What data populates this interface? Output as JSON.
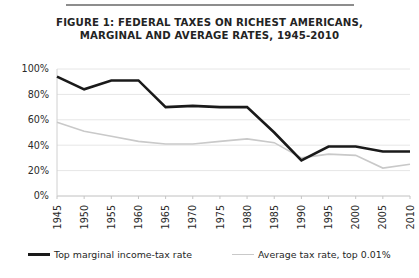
{
  "figure": {
    "rule_color": "#8d8d8d",
    "title_line1": "FIGURE 1: FEDERAL TAXES ON RICHEST AMERICANS,",
    "title_line2": "MARGINAL AND AVERAGE RATES, 1945-2010"
  },
  "legend": {
    "entries": [
      {
        "label": "Top marginal income-tax rate",
        "color": "#1a1a1a",
        "style": "thick"
      },
      {
        "label": "Average tax rate, top 0.01%",
        "color": "#c9c9c9",
        "style": "thin"
      }
    ]
  },
  "chart_data": {
    "type": "line",
    "title": "FIGURE 1: FEDERAL TAXES ON RICHEST AMERICANS, MARGINAL AND AVERAGE RATES, 1945-2010",
    "xlabel": "",
    "ylabel": "",
    "x": [
      1945,
      1950,
      1955,
      1960,
      1965,
      1970,
      1975,
      1980,
      1985,
      1990,
      1995,
      2000,
      2005,
      2010
    ],
    "xtick_labels": [
      "1945",
      "1950",
      "1955",
      "1960",
      "1965",
      "1970",
      "1975",
      "1980",
      "1985",
      "1990",
      "1995",
      "2000",
      "2005",
      "2010"
    ],
    "ytick_labels": [
      "0%",
      "20%",
      "40%",
      "60%",
      "80%",
      "100%"
    ],
    "yticks": [
      0,
      20,
      40,
      60,
      80,
      100
    ],
    "ylim": [
      0,
      100
    ],
    "xlim": [
      1945,
      2010
    ],
    "grid": true,
    "grid_axis": "y",
    "legend_position": "bottom",
    "series": [
      {
        "name": "Top marginal income-tax rate",
        "color": "#1a1a1a",
        "width": 2.6,
        "values": [
          94,
          84,
          91,
          91,
          70,
          71,
          70,
          70,
          50,
          28,
          39,
          39,
          35,
          35
        ]
      },
      {
        "name": "Average tax rate, top 0.01%",
        "color": "#c9c9c9",
        "width": 1.6,
        "values": [
          58,
          51,
          47,
          43,
          41,
          41,
          43,
          45,
          42,
          30,
          33,
          32,
          22,
          25
        ]
      }
    ]
  }
}
